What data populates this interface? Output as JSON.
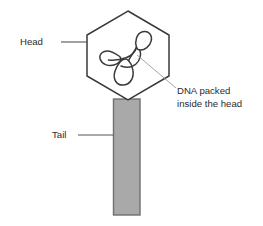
{
  "figure": {
    "background_color": "#ffffff"
  },
  "labels": {
    "head": "Head",
    "tail": "Tail",
    "dna_line1": "DNA packed",
    "dna_line2": "inside the head"
  },
  "colors": {
    "text": "#2b2b2b",
    "outline": "#3a3a3a",
    "head_fill": "#ffffff",
    "tail_fill": "#a9a9a9",
    "tail_stroke": "#6f6f6f",
    "dna_stroke": "#3a3a3a",
    "leader_line": "#555555",
    "thin_leader_line": "#9a9a9a"
  },
  "parts": [
    {
      "name": "head",
      "shape": "hexagon",
      "label": "Head"
    },
    {
      "name": "tail",
      "shape": "rectangle",
      "label": "Tail"
    },
    {
      "name": "dna",
      "shape": "coiled-loops",
      "label": "DNA packed inside the head"
    }
  ],
  "geometry": {
    "head_hexagon_points": "128,11 169,35 169,76 128,100 87,76 87,35",
    "tail_rect": {
      "x": 113,
      "y": 99,
      "width": 27,
      "height": 116
    },
    "head_leader": {
      "x1": 61,
      "y1": 42,
      "x2": 87,
      "y2": 42
    },
    "tail_leader": {
      "x1": 78,
      "y1": 135,
      "x2": 113,
      "y2": 135
    },
    "dna_leader": {
      "x1": 137,
      "y1": 55,
      "x2": 176,
      "y2": 88
    },
    "head_label_pos": {
      "x": 20,
      "y": 42
    },
    "tail_label_pos": {
      "x": 52,
      "y": 135
    },
    "dna_label_pos": {
      "x": 178,
      "y": 90
    }
  }
}
